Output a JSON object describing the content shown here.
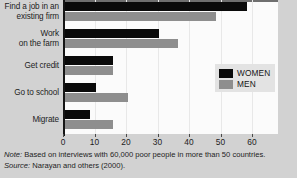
{
  "chart_data": {
    "type": "bar",
    "orientation": "horizontal",
    "title": "",
    "xlabel": "",
    "ylabel": "",
    "xlim": [
      0,
      68
    ],
    "xticks": [
      0,
      10,
      20,
      30,
      40,
      50,
      60
    ],
    "xtick_labels": [
      "0",
      "10",
      "20",
      "30",
      "40",
      "50",
      "60"
    ],
    "grid": true,
    "legend_position": "center-right",
    "categories": [
      "Find a job in an existing firm",
      "Work on the farm",
      "Get credit",
      "Go to school",
      "Migrate"
    ],
    "category_lines": [
      [
        "Find a job in an",
        "existing firm"
      ],
      [
        "Work",
        "on the farm"
      ],
      [
        "Get credit"
      ],
      [
        "Go to school"
      ],
      [
        "Migrate"
      ]
    ],
    "series": [
      {
        "name": "WOMEN",
        "color": "#0a0a0a",
        "values": [
          58,
          30,
          15.5,
          10,
          8
        ]
      },
      {
        "name": "MEN",
        "color": "#8e8e8e",
        "values": [
          48,
          36,
          15.5,
          20,
          15.5
        ]
      }
    ],
    "annotations": [
      "Note: Based on interviews with 60,000 poor people in more than 50 countries.",
      "Source: Narayan and others (2000)."
    ]
  },
  "legend": {
    "items": [
      {
        "label": "WOMEN",
        "color": "#0a0a0a"
      },
      {
        "label": "MEN",
        "color": "#8e8e8e"
      }
    ]
  },
  "notes": {
    "note_key": "Note:",
    "note_text": " Based on interviews with 60,000 poor people in more than 50 countries.",
    "source_key": "Source:",
    "source_text": " Narayan and others (2000)."
  },
  "colors": {
    "women": "#0a0a0a",
    "men": "#8e8e8e",
    "background": "#d2d2d2",
    "plot_background": "#fbfbfb",
    "axis": "#151515"
  }
}
